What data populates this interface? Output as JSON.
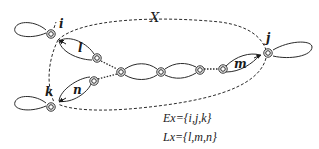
{
  "diagram": {
    "region_label": "X",
    "nodes": {
      "i": {
        "label": "i",
        "x": 51,
        "y": 34
      },
      "j": {
        "label": "j",
        "x": 268,
        "y": 53
      },
      "k": {
        "label": "k",
        "x": 51,
        "y": 107
      }
    },
    "link_labels": {
      "l": "l",
      "m": "m",
      "n": "n"
    },
    "sets": {
      "ex": "Ex={i,j,k}",
      "lx": "Lx={l,m,n}"
    },
    "colors": {
      "stroke": "#2a2a2a",
      "background": "#ffffff"
    }
  }
}
